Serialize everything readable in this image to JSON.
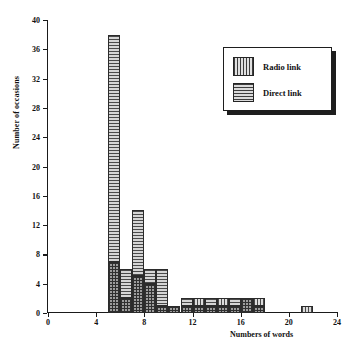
{
  "chart_data": {
    "type": "bar",
    "title": "",
    "subtitle": "",
    "xlabel": "Numbers of words",
    "ylabel": "Number of occasions",
    "xlim": [
      0,
      24
    ],
    "ylim": [
      0,
      40
    ],
    "xticks": [
      0,
      4,
      8,
      12,
      16,
      20,
      24
    ],
    "yticks": [
      0,
      4,
      8,
      12,
      16,
      20,
      24,
      28,
      32,
      36,
      40
    ],
    "grid": false,
    "legend_position": "upper-right",
    "bin_width": 1,
    "bin_starts": [
      5,
      6,
      7,
      8,
      9,
      10,
      11,
      12,
      13,
      14,
      15,
      16,
      17,
      21
    ],
    "series": [
      {
        "name": "Radio link",
        "pattern": "vertical-hatch",
        "color": "#c6c6c6",
        "values": [
          7,
          2,
          5,
          4,
          1,
          1,
          1,
          2,
          1,
          2,
          1,
          2,
          2,
          1
        ]
      },
      {
        "name": "Direct link",
        "pattern": "horizontal-hatch",
        "color": "#b9b9b9",
        "values": [
          38,
          6,
          14,
          6,
          6,
          1,
          2,
          1,
          2,
          1,
          2,
          2,
          1,
          0
        ]
      }
    ]
  },
  "legend": {
    "items": [
      {
        "label": "Radio link",
        "swatch": "vertical-hatch-swatch"
      },
      {
        "label": "Direct link",
        "swatch": "horizontal-hatch-swatch"
      }
    ]
  },
  "axes": {
    "y_title": "Number of occasions",
    "x_title": "Numbers of words",
    "y_ticklabels": [
      "0",
      "4",
      "8",
      "12",
      "16",
      "20",
      "24",
      "28",
      "32",
      "36",
      "40"
    ],
    "x_ticklabels": [
      "0",
      "4",
      "8",
      "12",
      "16",
      "20",
      "24"
    ]
  }
}
